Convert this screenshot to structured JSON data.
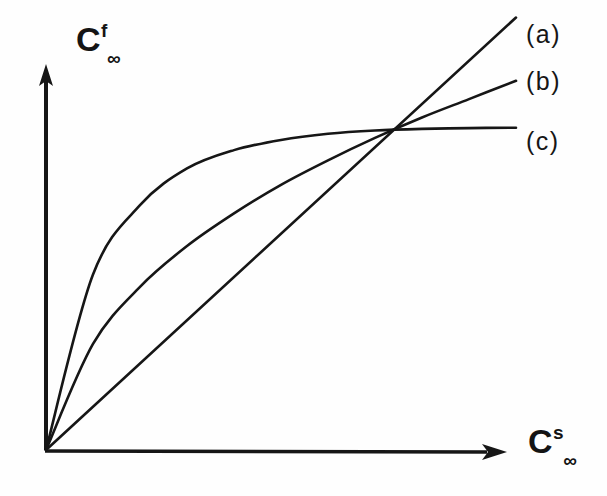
{
  "figure": {
    "background_color": "#fefefe",
    "ink_color": "#161616",
    "axes": {
      "y_axis": {
        "name": "y-axis",
        "label_base": "C",
        "label_superscript": "f",
        "label_subscript": "∞",
        "arrow": true,
        "origin_px": [
          45,
          450
        ],
        "tip_px": [
          45,
          66
        ]
      },
      "x_axis": {
        "name": "x-axis",
        "label_base": "C",
        "label_superscript": "s",
        "label_subscript": "∞",
        "arrow": true,
        "origin_px": [
          45,
          450
        ],
        "tip_px": [
          506,
          452
        ]
      }
    },
    "curve_labels": [
      {
        "id": "a",
        "text": "(a)"
      },
      {
        "id": "b",
        "text": "(b)"
      },
      {
        "id": "c",
        "text": "(c)"
      }
    ]
  },
  "chart_data": {
    "type": "line",
    "title": "",
    "subtitle": "",
    "xlabel": "C^s_∞",
    "ylabel": "C^f_∞",
    "xlim": [
      0,
      1
    ],
    "ylim": [
      0,
      1
    ],
    "grid": false,
    "ticks": {
      "x": [],
      "y": []
    },
    "legend_position": "right-of-curve-ends",
    "annotations": [
      "(a)",
      "(b)",
      "(c)"
    ],
    "series": [
      {
        "name": "(a)",
        "label": "(a)",
        "shape": "linear",
        "color": "#161616",
        "x": [
          0.0,
          0.1,
          0.2,
          0.3,
          0.4,
          0.5,
          0.6,
          0.7,
          0.8,
          0.9,
          1.0
        ],
        "y": [
          0.0,
          0.106,
          0.212,
          0.318,
          0.424,
          0.53,
          0.636,
          0.742,
          0.848,
          0.954,
          1.06
        ]
      },
      {
        "name": "(b)",
        "label": "(b)",
        "shape": "concave-freundlich",
        "color": "#161616",
        "x": [
          0.0,
          0.1,
          0.2,
          0.3,
          0.4,
          0.5,
          0.6,
          0.7,
          0.8,
          0.9,
          1.0
        ],
        "y": [
          0.0,
          0.26,
          0.4,
          0.5,
          0.58,
          0.65,
          0.71,
          0.765,
          0.815,
          0.86,
          0.905
        ]
      },
      {
        "name": "(c)",
        "label": "(c)",
        "shape": "langmuir-saturating",
        "color": "#161616",
        "x": [
          0.0,
          0.1,
          0.2,
          0.3,
          0.4,
          0.5,
          0.6,
          0.7,
          0.8,
          0.9,
          1.0
        ],
        "y": [
          0.0,
          0.43,
          0.6,
          0.69,
          0.735,
          0.76,
          0.775,
          0.783,
          0.787,
          0.789,
          0.79
        ]
      }
    ]
  }
}
